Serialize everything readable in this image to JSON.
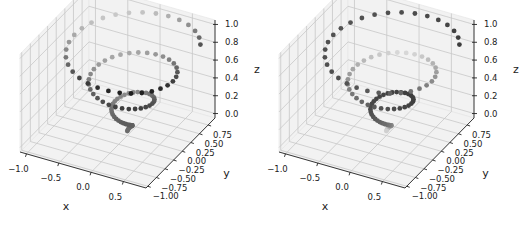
{
  "chart_data": [
    {
      "type": "scatter",
      "projection": "3d",
      "title": "",
      "description": "Conical helix scatter, shaded by depth",
      "shading": "depth",
      "xlabel": "x",
      "ylabel": "y",
      "zlabel": "z",
      "xlim": [
        -1.1,
        0.85
      ],
      "ylim": [
        -1.05,
        0.95
      ],
      "zlim": [
        -0.05,
        1.05
      ],
      "xticks": [
        "−1.0",
        "−0.5",
        "0.0",
        "0.5"
      ],
      "xtick_values": [
        -1.0,
        -0.5,
        0.0,
        0.5
      ],
      "yticks": [
        "−1.00",
        "−0.75",
        "−0.50",
        "−0.25",
        "0.00",
        "0.25",
        "0.50",
        "0.75"
      ],
      "ytick_values": [
        -1.0,
        -0.75,
        -0.5,
        -0.25,
        0.0,
        0.25,
        0.5,
        0.75
      ],
      "zticks": [
        "0.0",
        "0.2",
        "0.4",
        "0.6",
        "0.8",
        "1.0"
      ],
      "ztick_values": [
        0.0,
        0.2,
        0.4,
        0.6,
        0.8,
        1.0
      ],
      "series": {
        "name": "helix",
        "equation": "x = z*sin(t), y = z*cos(t), t = 20*z",
        "z_range": [
          0,
          1
        ],
        "n_points": 100
      },
      "grid": true
    },
    {
      "type": "scatter",
      "projection": "3d",
      "title": "",
      "description": "Same conical helix scatter, colored by point order (gray colormap)",
      "shading": "colormap",
      "xlabel": "x",
      "ylabel": "y",
      "zlabel": "z",
      "xlim": [
        -1.1,
        0.85
      ],
      "ylim": [
        -1.05,
        0.95
      ],
      "zlim": [
        -0.05,
        1.05
      ],
      "xticks": [
        "−1.0",
        "−0.5",
        "0.0",
        "0.5"
      ],
      "xtick_values": [
        -1.0,
        -0.5,
        0.0,
        0.5
      ],
      "yticks": [
        "−1.00",
        "−0.75",
        "−0.50",
        "−0.25",
        "0.00",
        "0.25",
        "0.50",
        "0.75"
      ],
      "ytick_values": [
        -1.0,
        -0.75,
        -0.5,
        -0.25,
        0.0,
        0.25,
        0.5,
        0.75
      ],
      "zticks": [
        "0.0",
        "0.2",
        "0.4",
        "0.6",
        "0.8",
        "1.0"
      ],
      "ztick_values": [
        0.0,
        0.2,
        0.4,
        0.6,
        0.8,
        1.0
      ],
      "series": {
        "name": "helix",
        "equation": "x = z*sin(t), y = z*cos(t), t = 20*z",
        "z_range": [
          0,
          1
        ],
        "n_points": 100
      },
      "grid": true
    }
  ],
  "colors": {
    "pane_fill": "#f2f2f2",
    "grid": "#c8c8c8",
    "axis_line": "#222222",
    "marker_dark": "#1e1e1e",
    "marker_light": "#e6e6e6"
  }
}
